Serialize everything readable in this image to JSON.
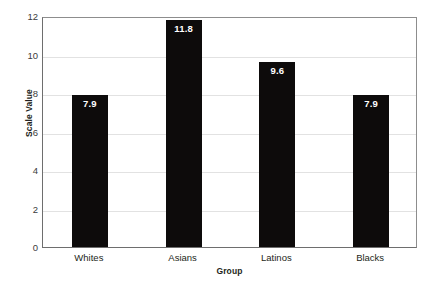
{
  "chart_data": {
    "type": "bar",
    "title": "",
    "xlabel": "Group",
    "ylabel": "Scale Value",
    "categories": [
      "Whites",
      "Asians",
      "Latinos",
      "Blacks"
    ],
    "values": [
      7.9,
      11.8,
      9.6,
      7.9
    ],
    "value_labels": [
      "7.9",
      "11.8",
      "9.6",
      "7.9"
    ],
    "ylim": [
      0,
      12
    ],
    "yticks": [
      0,
      2,
      4,
      6,
      8,
      10,
      12
    ],
    "ytick_labels": [
      "0",
      "2",
      "4",
      "6",
      "8",
      "10",
      "12"
    ],
    "grid": true,
    "legend": "none",
    "bar_color": "#0d0b0b",
    "value_label_color": "#ffffff",
    "gridline_color": "#e2e2e2",
    "axis_color": "#6e6e6e",
    "background_color": "#ffffff"
  }
}
